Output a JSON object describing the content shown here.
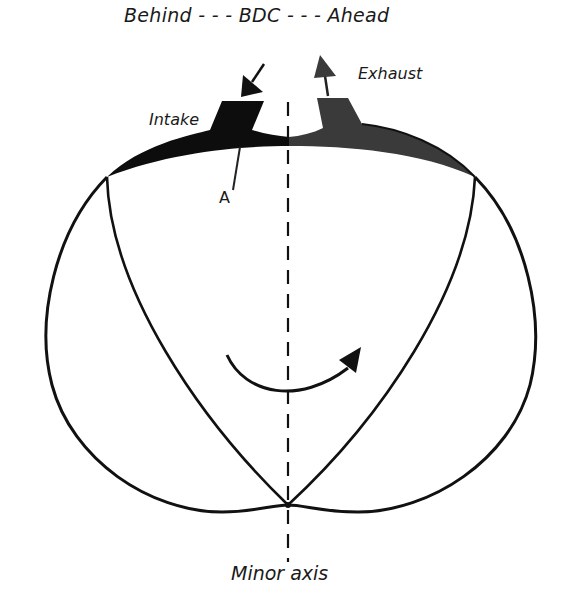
{
  "diagram": {
    "type": "rotary-engine-port-timing",
    "top_label": {
      "left": "Behind",
      "center": "BDC",
      "right": "Ahead",
      "full_text": "Behind - - - BDC - - - Ahead"
    },
    "labels": {
      "intake": "Intake",
      "exhaust": "Exhaust",
      "point": "A",
      "axis": "Minor axis"
    },
    "colors": {
      "outline": "#111111",
      "intake_fill": "#0d0d0d",
      "exhaust_fill": "#3a3a3a",
      "background": "#ffffff"
    },
    "rotation_direction": "clockwise"
  }
}
